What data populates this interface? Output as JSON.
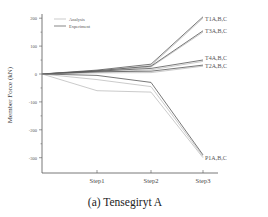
{
  "caption": "(a) Tensegiryt A",
  "chart_data": {
    "type": "line",
    "title": "",
    "xlabel": "",
    "ylabel": "Member Force (kN)",
    "x": [
      "0",
      "Step1",
      "Step2",
      "Step3"
    ],
    "x_tick_labels": [
      "Step1",
      "Step2",
      "Step3"
    ],
    "y_ticks": [
      200,
      100,
      0,
      -100,
      -200,
      -300
    ],
    "ylim": [
      -350,
      230
    ],
    "grid": false,
    "legend": {
      "position": "upper-left",
      "entries": [
        {
          "name": "Analysis",
          "color": "#b5b5b5"
        },
        {
          "name": "Experiment",
          "color": "#555555"
        }
      ]
    },
    "annotations": [
      "T1A,B,C",
      "T3A,B,C",
      "T4A,B,C",
      "T2A,B,C",
      "P1A,B,C"
    ],
    "series": [
      {
        "name": "T1 Analysis",
        "group": "Analysis",
        "label": "T1A,B,C",
        "values": [
          0,
          10,
          30,
          200
        ]
      },
      {
        "name": "T1 Experiment",
        "group": "Experiment",
        "label": "T1A,B,C",
        "values": [
          0,
          14,
          35,
          205
        ]
      },
      {
        "name": "T3 Analysis",
        "group": "Analysis",
        "label": "T3A,B,C",
        "values": [
          0,
          8,
          25,
          150
        ]
      },
      {
        "name": "T3 Experiment",
        "group": "Experiment",
        "label": "T3A,B,C",
        "values": [
          0,
          12,
          28,
          155
        ]
      },
      {
        "name": "T4 Analysis",
        "group": "Analysis",
        "label": "T4A,B,C",
        "values": [
          0,
          6,
          15,
          45
        ]
      },
      {
        "name": "T4 Experiment",
        "group": "Experiment",
        "label": "T4A,B,C",
        "values": [
          0,
          10,
          20,
          50
        ]
      },
      {
        "name": "T2 Analysis",
        "group": "Analysis",
        "label": "T2A,B,C",
        "values": [
          0,
          4,
          5,
          28
        ]
      },
      {
        "name": "T2 Experiment",
        "group": "Experiment",
        "label": "T2A,B,C",
        "values": [
          0,
          8,
          10,
          32
        ]
      },
      {
        "name": "P1 Analysis A",
        "group": "Analysis",
        "label": "P1A,B,C",
        "values": [
          0,
          -60,
          -65,
          -300
        ]
      },
      {
        "name": "P1 Analysis B",
        "group": "Analysis",
        "label": "P1A,B,C",
        "values": [
          0,
          -20,
          -45,
          -295
        ]
      },
      {
        "name": "P1 Experiment",
        "group": "Experiment",
        "label": "P1A,B,C",
        "values": [
          0,
          -5,
          -30,
          -290
        ]
      }
    ]
  }
}
